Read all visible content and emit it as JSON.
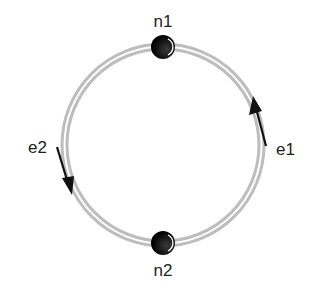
{
  "diagram": {
    "type": "graph",
    "nodes": [
      {
        "id": "n1",
        "label": "n1",
        "position": "top"
      },
      {
        "id": "n2",
        "label": "n2",
        "position": "bottom"
      }
    ],
    "edges": [
      {
        "id": "e1",
        "label": "e1",
        "from": "n2",
        "to": "n1",
        "side": "right",
        "direction": "upward"
      },
      {
        "id": "e2",
        "label": "e2",
        "from": "n1",
        "to": "n2",
        "side": "left",
        "direction": "downward"
      }
    ],
    "colors": {
      "ring": "#b8b8b8",
      "node": "#111111",
      "arrow": "#111111",
      "text": "#222222"
    }
  }
}
